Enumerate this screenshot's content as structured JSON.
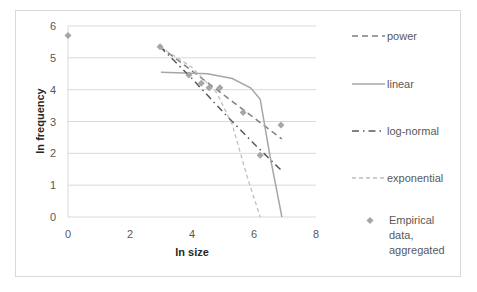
{
  "chart_data": {
    "type": "line",
    "title": "",
    "xlabel": "ln size",
    "ylabel": "ln frequency",
    "xlim": [
      0,
      8
    ],
    "ylim": [
      0,
      6
    ],
    "x_ticks": [
      "0",
      "2",
      "4",
      "6",
      "8"
    ],
    "y_ticks": [
      "0",
      "1",
      "2",
      "3",
      "4",
      "5",
      "6"
    ],
    "grid": "horizontal",
    "legend_position": "right",
    "series": [
      {
        "name": "power",
        "style": "dashed",
        "color": "#7f7f7f",
        "x": [
          2.97,
          6.9
        ],
        "y": [
          5.35,
          2.45
        ]
      },
      {
        "name": "linear",
        "style": "solid",
        "color": "#a6a6a6",
        "x": [
          3.0,
          4.5,
          5.3,
          5.9,
          6.2,
          6.5,
          6.9
        ],
        "y": [
          4.55,
          4.5,
          4.35,
          4.05,
          3.7,
          2.0,
          0.0
        ]
      },
      {
        "name": "log-normal",
        "style": "dash-dot",
        "color": "#595959",
        "x": [
          2.97,
          4.0,
          5.0,
          6.0,
          6.9
        ],
        "y": [
          5.35,
          4.35,
          3.3,
          2.3,
          1.45
        ]
      },
      {
        "name": "exponential",
        "style": "dotted-dashed-light",
        "color": "#bfbfbf",
        "x": [
          2.97,
          4.0,
          4.8,
          5.3,
          5.8,
          6.2
        ],
        "y": [
          5.35,
          4.7,
          3.9,
          2.9,
          1.2,
          0.0
        ]
      },
      {
        "name": "Empirical data, aggregated",
        "style": "marker-diamond",
        "color": "#a6a6a6",
        "x": [
          0.0,
          2.97,
          3.9,
          4.3,
          4.55,
          4.9,
          5.65,
          6.2,
          6.87
        ],
        "y": [
          5.7,
          5.35,
          4.46,
          4.2,
          4.06,
          4.06,
          3.28,
          1.94,
          2.89
        ]
      }
    ]
  },
  "legend": {
    "items": [
      {
        "label": "power"
      },
      {
        "label": "linear"
      },
      {
        "label": "log-normal"
      },
      {
        "label": "exponential"
      },
      {
        "label_lines": [
          "Empirical",
          "data,",
          "aggregated"
        ]
      }
    ]
  }
}
